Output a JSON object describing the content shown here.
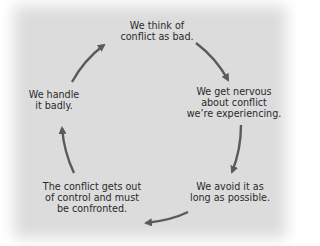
{
  "diagram": {
    "type": "cycle",
    "nodes": [
      {
        "id": "n1",
        "lines": [
          "We think of",
          "conflict as bad."
        ]
      },
      {
        "id": "n2",
        "lines": [
          "We get nervous",
          "about conflict",
          "we’re experiencing."
        ]
      },
      {
        "id": "n3",
        "lines": [
          "We avoid it as",
          "long as possible."
        ]
      },
      {
        "id": "n4",
        "lines": [
          "The conflict gets out",
          "of control and must",
          "be confronted."
        ]
      },
      {
        "id": "n5",
        "lines": [
          "We handle",
          "it badly."
        ]
      }
    ],
    "edges": [
      {
        "from": "n1",
        "to": "n2"
      },
      {
        "from": "n2",
        "to": "n3"
      },
      {
        "from": "n3",
        "to": "n4"
      },
      {
        "from": "n4",
        "to": "n5"
      },
      {
        "from": "n5",
        "to": "n1"
      }
    ],
    "colors": {
      "background": "#dcdcdc",
      "arrow": "#5a5a5a",
      "text": "#2a2a2a"
    }
  }
}
